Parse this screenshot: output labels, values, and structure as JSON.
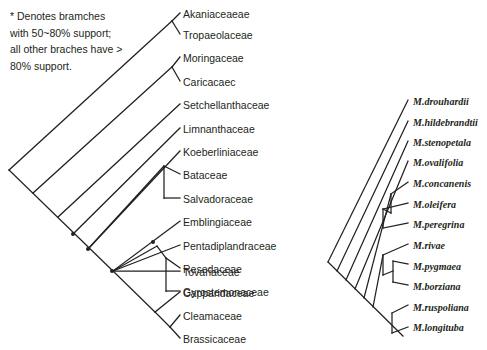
{
  "figure": {
    "background_color": "#ffffff",
    "line_color": "#231f20",
    "text_color": "#231f20"
  },
  "legend": {
    "name": "support-legend",
    "text": "* Denotes bramches\nwith 50~80% support;\nall other braches have >\n80% support.",
    "lines": [
      "* Denotes bramches",
      "with 50~80% support;",
      "all other braches have >",
      "80% support."
    ]
  },
  "left_tree": {
    "name": "family-level-cladogram",
    "tip_count": 16,
    "label_x": 183,
    "first_label_y": 14,
    "label_spacing": 23.4,
    "root": {
      "x": 9,
      "y": 170
    },
    "tips": [
      {
        "label": "Akaniaceaeae",
        "y": 14
      },
      {
        "label": "Tropaeolaceae",
        "y": 37
      },
      {
        "label": "Moringaceae",
        "y": 60
      },
      {
        "label": "Caricacaec",
        "y": 84
      },
      {
        "label": "Setchellanthaceae",
        "y": 107
      },
      {
        "label": "Limnanthaceae",
        "y": 131
      },
      {
        "label": "Koeberliniaceae",
        "y": 154
      },
      {
        "label": "Bataceae",
        "y": 178
      },
      {
        "label": "Salvadoraceae",
        "y": 201
      },
      {
        "label": "Emblingiaceae",
        "y": 224
      },
      {
        "label": "Pentadiplandraceae",
        "y": 248
      },
      {
        "label": "Resedaceae",
        "y": 271
      },
      {
        "label": "Gyrostemonaceae",
        "y": 295
      },
      {
        "label": "Tovariaceae",
        "y": 318
      },
      {
        "label": "Capparidaceae",
        "y": 342
      },
      {
        "label": "Cleamaceae",
        "y": 365
      },
      {
        "label": "Brassicaceae",
        "y": 389
      }
    ],
    "support_markers": [
      {
        "name": "support-marker-1",
        "x": 73,
        "y": 234
      },
      {
        "name": "support-marker-2",
        "x": 88,
        "y": 249
      },
      {
        "name": "support-marker-3",
        "x": 112,
        "y": 271
      },
      {
        "name": "support-marker-4",
        "x": 153,
        "y": 242
      }
    ]
  },
  "right_tree": {
    "name": "moringa-species-cladogram",
    "tip_count": 13,
    "label_x": 413,
    "first_label_y": 103,
    "label_spacing": 23.4,
    "root": {
      "x": 328,
      "y": 262
    },
    "tips": [
      {
        "label": "M.drouhardii",
        "y": 103
      },
      {
        "label": "M.hildebrandtii",
        "y": 123
      },
      {
        "label": "M.stenopetala",
        "y": 144
      },
      {
        "label": "M.ovalifolia",
        "y": 164
      },
      {
        "label": "M.concanenis",
        "y": 185
      },
      {
        "label": "M.oleifera",
        "y": 205
      },
      {
        "label": "M.peregrina",
        "y": 226
      },
      {
        "label": "M.rivae",
        "y": 246
      },
      {
        "label": "M.pygmaea",
        "y": 267
      },
      {
        "label": "M.borziana",
        "y": 287
      },
      {
        "label": "M.ruspoliana",
        "y": 308
      },
      {
        "label": "M.longituba",
        "y": 328
      }
    ]
  }
}
